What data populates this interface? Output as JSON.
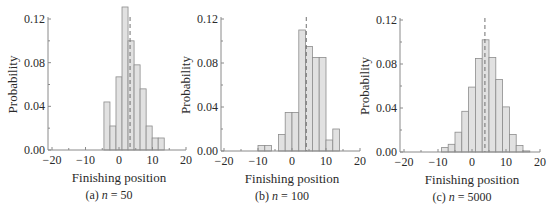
{
  "figure": {
    "panels": [
      {
        "caption_prefix": "(a) ",
        "caption_var": "n",
        "caption_value": " = 50"
      },
      {
        "caption_prefix": "(b) ",
        "caption_var": "n",
        "caption_value": " = 100"
      },
      {
        "caption_prefix": "(c) ",
        "caption_var": "n",
        "caption_value": " = 5000"
      }
    ]
  },
  "colors": {
    "bar_fill": "#e1e1e1",
    "bar_edge": "#8c8c8c",
    "mean_line": "#707070",
    "axis": "#8a8a8a"
  },
  "chart_data": [
    {
      "type": "bar",
      "title": "(a) n = 50",
      "xlabel": "Finishing position",
      "ylabel": "Probability",
      "xlim": [
        -21.5,
        20
      ],
      "ylim": [
        0,
        0.12
      ],
      "xticks": [
        -20,
        -10,
        0,
        10,
        20
      ],
      "yticks": [
        0.0,
        0.04,
        0.08,
        0.12
      ],
      "ytick_labels": [
        "0.00",
        "0.04",
        "0.08",
        "0.12"
      ],
      "grid": false,
      "bin_width": 1.8,
      "bin_left_edges": [
        -4.5,
        -2.7,
        -0.9,
        0.9,
        2.7,
        4.5,
        6.3,
        8.1,
        9.9,
        11.7
      ],
      "values": [
        0.044,
        0.022,
        0.067,
        0.131,
        0.1,
        0.078,
        0.056,
        0.022,
        0.011,
        0.011
      ],
      "mean_line_x": 3.3
    },
    {
      "type": "bar",
      "title": "(b) n = 100",
      "xlabel": "Finishing position",
      "ylabel": "Probability",
      "xlim": [
        -21.5,
        20
      ],
      "ylim": [
        0,
        0.12
      ],
      "xticks": [
        -20,
        -10,
        0,
        10,
        20
      ],
      "yticks": [
        0.0,
        0.04,
        0.08,
        0.12
      ],
      "ytick_labels": [
        "0.00",
        "0.04",
        "0.08",
        "0.12"
      ],
      "grid": false,
      "bin_width": 2,
      "bin_left_edges": [
        -10,
        -8,
        -6,
        -4,
        -2,
        0,
        2,
        4,
        6,
        8,
        10,
        12
      ],
      "values": [
        0.005,
        0.005,
        0.0,
        0.015,
        0.035,
        0.035,
        0.11,
        0.095,
        0.085,
        0.085,
        0.01,
        0.02
      ],
      "mean_line_x": 4.2
    },
    {
      "type": "bar",
      "title": "(c) n = 5000",
      "xlabel": "Finishing position",
      "ylabel": "Probability",
      "xlim": [
        -21.5,
        20
      ],
      "ylim": [
        0,
        0.12
      ],
      "xticks": [
        -20,
        -10,
        0,
        10,
        20
      ],
      "yticks": [
        0.0,
        0.04,
        0.08,
        0.12
      ],
      "ytick_labels": [
        "0.00",
        "0.04",
        "0.08",
        "0.12"
      ],
      "grid": false,
      "bin_width": 2,
      "bin_left_edges": [
        -9,
        -7,
        -5,
        -3,
        -1,
        1,
        3,
        5,
        7,
        9,
        11,
        13,
        15
      ],
      "values": [
        0.004,
        0.007,
        0.018,
        0.037,
        0.059,
        0.085,
        0.102,
        0.086,
        0.066,
        0.041,
        0.016,
        0.006,
        0.001
      ],
      "mean_line_x": 3.8
    }
  ]
}
